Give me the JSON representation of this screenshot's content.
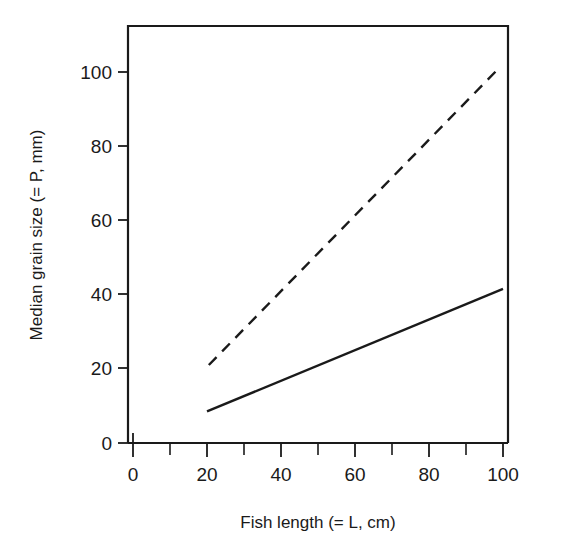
{
  "chart_data": {
    "type": "line",
    "title": "",
    "subtitle": "",
    "xlabel": "Fish length (= L, cm)",
    "ylabel": "Median grain size (= P, mm)",
    "xlim": [
      0,
      110
    ],
    "ylim": [
      0,
      112
    ],
    "grid": false,
    "legend": "none",
    "x_ticks_major": [
      0,
      20,
      40,
      60,
      80,
      100
    ],
    "x_ticks_minor": [
      10,
      30,
      50,
      70,
      90
    ],
    "x_tick_labels": [
      "0",
      "20",
      "40",
      "60",
      "80",
      "100"
    ],
    "y_ticks_major": [
      0,
      20,
      40,
      60,
      80,
      100
    ],
    "y_tick_labels": [
      "0",
      "20",
      "40",
      "60",
      "80",
      "100"
    ],
    "series": [
      {
        "name": "lower-relationship",
        "style": "solid",
        "color": "#1a1a1a",
        "x": [
          20,
          100
        ],
        "y": [
          8.5,
          41.5
        ]
      },
      {
        "name": "upper-relationship",
        "style": "dashed",
        "color": "#1a1a1a",
        "x": [
          20.5,
          99
        ],
        "y": [
          21,
          101
        ]
      }
    ]
  },
  "axes": {
    "x_axis_name": "x-axis",
    "y_axis_name": "y-axis"
  }
}
